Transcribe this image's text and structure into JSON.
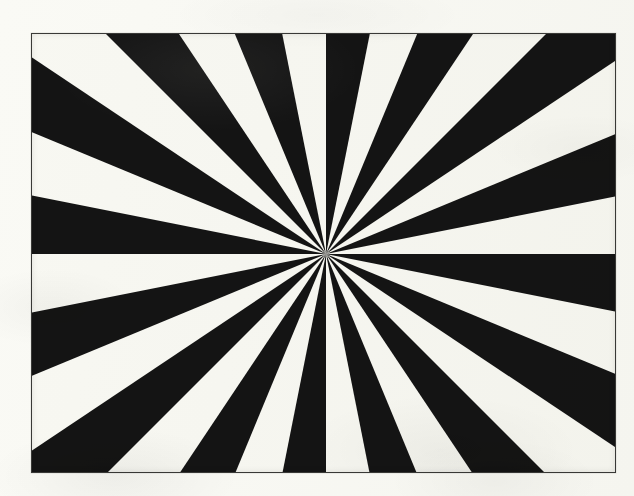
{
  "page": {
    "width": 634,
    "height": 496,
    "background_color": "#fdfdfb",
    "description": "Scanned black-and-white radial sunburst figure inside a thin rectangular frame"
  },
  "figure": {
    "caption": "",
    "frame": {
      "x": 31,
      "y": 33,
      "width": 585,
      "height": 440,
      "border_color": "#3a3a38",
      "border_width": 1,
      "fill_color": "#fcfcfa"
    }
  },
  "chart_data": {
    "type": "pie",
    "title": "",
    "subtitle": "",
    "xlabel": "",
    "ylabel": "",
    "legend": [],
    "annotations": [],
    "grid": false,
    "pattern": "radial-sunburst",
    "sector_count": 32,
    "sector_angle_degrees": 11.25,
    "black_sector_count": 16,
    "white_sector_count": 16,
    "start_angle_degrees": 0,
    "center": {
      "x": 294,
      "y": 220
    },
    "ray_length": 900,
    "colors": {
      "dark": "#141414",
      "light": "#fbfbf8"
    },
    "categories": [
      "s01",
      "s02",
      "s03",
      "s04",
      "s05",
      "s06",
      "s07",
      "s08",
      "s09",
      "s10",
      "s11",
      "s12",
      "s13",
      "s14",
      "s15",
      "s16",
      "s17",
      "s18",
      "s19",
      "s20",
      "s21",
      "s22",
      "s23",
      "s24",
      "s25",
      "s26",
      "s27",
      "s28",
      "s29",
      "s30",
      "s31",
      "s32"
    ],
    "values": [
      11.25,
      11.25,
      11.25,
      11.25,
      11.25,
      11.25,
      11.25,
      11.25,
      11.25,
      11.25,
      11.25,
      11.25,
      11.25,
      11.25,
      11.25,
      11.25,
      11.25,
      11.25,
      11.25,
      11.25,
      11.25,
      11.25,
      11.25,
      11.25,
      11.25,
      11.25,
      11.25,
      11.25,
      11.25,
      11.25,
      11.25,
      11.25
    ],
    "slice_colors": [
      "#141414",
      "#fbfbf8",
      "#141414",
      "#fbfbf8",
      "#141414",
      "#fbfbf8",
      "#141414",
      "#fbfbf8",
      "#141414",
      "#fbfbf8",
      "#141414",
      "#fbfbf8",
      "#141414",
      "#fbfbf8",
      "#141414",
      "#fbfbf8",
      "#141414",
      "#fbfbf8",
      "#141414",
      "#fbfbf8",
      "#141414",
      "#fbfbf8",
      "#141414",
      "#fbfbf8",
      "#141414",
      "#fbfbf8",
      "#141414",
      "#fbfbf8",
      "#141414",
      "#fbfbf8",
      "#141414",
      "#fbfbf8"
    ]
  }
}
